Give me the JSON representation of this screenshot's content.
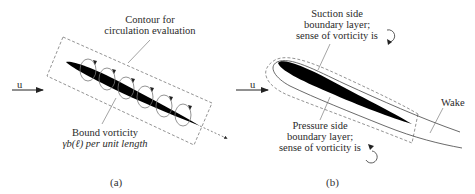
{
  "panel_a": {
    "contour_label_line1": "Contour for",
    "contour_label_line2": "circulation evaluation",
    "flow_label": "u",
    "bound_label_line1": "Bound vorticity",
    "bound_label_line2": "γb(ℓ) per unit length",
    "caption": "(a)"
  },
  "panel_b": {
    "suction_line1": "Suction side",
    "suction_line2": "boundary layer;",
    "suction_line3": "sense of vorticity is",
    "pressure_line1": "Pressure side",
    "pressure_line2": "boundary layer;",
    "pressure_line3": "sense of vorticity is",
    "wake_label": "Wake",
    "flow_label": "u",
    "caption": "(b)"
  },
  "colors": {
    "airfoil": "#000000",
    "line": "#555555",
    "dashed": "#777777",
    "text": "#2a2a2a"
  }
}
